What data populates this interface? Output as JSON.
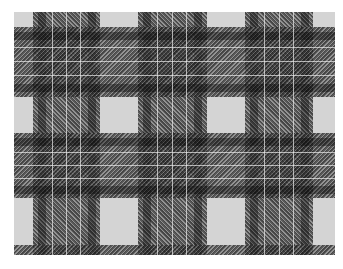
{
  "image": {
    "subject": "black, grey and white tartan plaid fabric pattern",
    "colors": {
      "background": "#ffffff",
      "light_ground": "#d4d4d4",
      "dark_band": "#3c3c3c",
      "pinstripe": "#ebebeb"
    },
    "vertical_bands": [
      {
        "left": 19,
        "width": 67
      },
      {
        "left": 124,
        "width": 69
      },
      {
        "left": 231,
        "width": 68
      }
    ],
    "horizontal_bands": [
      {
        "top": 15,
        "height": 70
      },
      {
        "top": 121,
        "height": 65
      },
      {
        "top": 233,
        "height": 10
      }
    ]
  }
}
